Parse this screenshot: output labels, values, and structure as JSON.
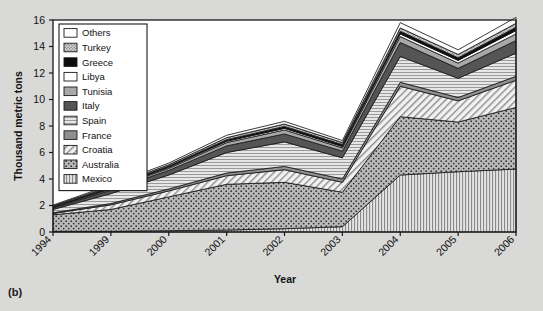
{
  "figure": {
    "panel_label": "(b)",
    "background_color": "#d9d9d7",
    "plot_background_color": "#ffffff"
  },
  "chart_data": {
    "type": "area",
    "stacked": true,
    "title": "",
    "xlabel": "Year",
    "ylabel": "Thousand metric tons",
    "categories": [
      "1994",
      "1999",
      "2000",
      "2001",
      "2002",
      "2003",
      "2004",
      "2005",
      "2006"
    ],
    "x_tick_labels": [
      "1994",
      "1999",
      "2000",
      "2001",
      "2002",
      "2003",
      "2004",
      "2005",
      "2006"
    ],
    "y_tick_labels": [
      "0",
      "2",
      "4",
      "6",
      "8",
      "10",
      "12",
      "14",
      "16"
    ],
    "y_ticks": [
      0,
      2,
      4,
      6,
      8,
      10,
      12,
      14,
      16
    ],
    "ylim": [
      0,
      16
    ],
    "grid": false,
    "legend_position": "top-left-inside",
    "stack_order_bottom_to_top": [
      "Mexico",
      "Australia",
      "Croatia",
      "France",
      "Spain",
      "Italy",
      "Tunisia",
      "Libya",
      "Greece",
      "Turkey",
      "Others"
    ],
    "series": [
      {
        "name": "Mexico",
        "pattern": "vertical-lines",
        "color": "#d2d2d2",
        "values": [
          0.05,
          0.05,
          0.1,
          0.15,
          0.25,
          0.4,
          4.3,
          4.55,
          4.75
        ]
      },
      {
        "name": "Australia",
        "pattern": "dots",
        "color": "#b3b3b3",
        "values": [
          1.25,
          1.65,
          2.55,
          3.45,
          3.5,
          2.6,
          4.4,
          3.75,
          4.65
        ]
      },
      {
        "name": "Croatia",
        "pattern": "diagonal-hatch",
        "color": "#ededed",
        "values": [
          0.1,
          0.35,
          0.45,
          0.65,
          0.95,
          0.75,
          2.3,
          1.6,
          2.05
        ]
      },
      {
        "name": "France",
        "pattern": "solid",
        "color": "#8f8f8f",
        "values": [
          0.05,
          0.1,
          0.15,
          0.2,
          0.25,
          0.25,
          0.3,
          0.25,
          0.3
        ]
      },
      {
        "name": "Spain",
        "pattern": "horiz-lines",
        "color": "#dcdcdc",
        "values": [
          0.25,
          0.75,
          1.05,
          1.55,
          1.85,
          1.6,
          1.95,
          1.45,
          1.75
        ]
      },
      {
        "name": "Italy",
        "pattern": "solid",
        "color": "#555555",
        "values": [
          0.1,
          0.25,
          0.35,
          0.5,
          0.6,
          0.5,
          1.05,
          0.75,
          0.95
        ]
      },
      {
        "name": "Tunisia",
        "pattern": "solid",
        "color": "#a8a8a8",
        "values": [
          0.05,
          0.1,
          0.15,
          0.25,
          0.3,
          0.25,
          0.45,
          0.4,
          0.5
        ]
      },
      {
        "name": "Libya",
        "pattern": "white",
        "color": "#ffffff",
        "values": [
          0.03,
          0.05,
          0.08,
          0.1,
          0.12,
          0.1,
          0.2,
          0.2,
          0.25
        ]
      },
      {
        "name": "Greece",
        "pattern": "black",
        "color": "#0d0d0d",
        "values": [
          0.05,
          0.08,
          0.1,
          0.12,
          0.15,
          0.15,
          0.2,
          0.2,
          0.25
        ]
      },
      {
        "name": "Turkey",
        "pattern": "fine-dots",
        "color": "#c9c9c9",
        "values": [
          0.05,
          0.08,
          0.1,
          0.15,
          0.18,
          0.15,
          0.25,
          0.25,
          0.3
        ]
      },
      {
        "name": "Others",
        "pattern": "white",
        "color": "#fcfcfc",
        "values": [
          0.05,
          0.1,
          0.12,
          0.18,
          0.2,
          0.15,
          0.4,
          0.35,
          0.45
        ]
      }
    ],
    "totals": [
      2.03,
      3.56,
      5.2,
      7.3,
      8.35,
      7.0,
      15.8,
      13.75,
      16.2
    ],
    "annotations": []
  },
  "legend": {
    "items": [
      {
        "label": "Others",
        "swatch": "white"
      },
      {
        "label": "Turkey",
        "swatch": "fine-dots"
      },
      {
        "label": "Greece",
        "swatch": "black"
      },
      {
        "label": "Libya",
        "swatch": "white"
      },
      {
        "label": "Tunisia",
        "swatch": "solid-mid-gray"
      },
      {
        "label": "Italy",
        "swatch": "solid-dark-gray"
      },
      {
        "label": "Spain",
        "swatch": "horiz-lines"
      },
      {
        "label": "France",
        "swatch": "solid-gray"
      },
      {
        "label": "Croatia",
        "swatch": "diagonal-hatch"
      },
      {
        "label": "Australia",
        "swatch": "dots"
      },
      {
        "label": "Mexico",
        "swatch": "vertical-lines"
      }
    ]
  }
}
